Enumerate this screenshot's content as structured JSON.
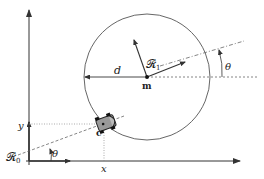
{
  "diagram": {
    "type": "robot-frame-geometry",
    "labels": {
      "frame0": "𝓡",
      "frame0_sub": "0",
      "frame1": "𝓡",
      "frame1_sub": "1",
      "distance": "d",
      "center_point": "m",
      "robot_point": "c",
      "angle_origin": "θ",
      "angle_right": "θ",
      "x_coord": "x",
      "y_coord": "y"
    },
    "colors": {
      "stroke": "#333333",
      "robot_fill": "#888888",
      "background": "#ffffff"
    }
  }
}
